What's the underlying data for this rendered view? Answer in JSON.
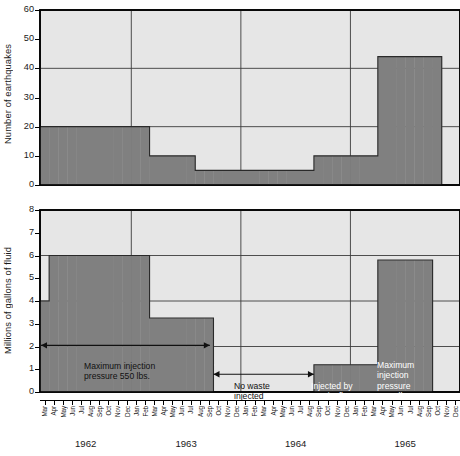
{
  "figure": {
    "width": 460,
    "height": 456,
    "bar_color": "#808080",
    "panel_bg": "#e6e6e6",
    "axis_color": "#000000",
    "grid_color": "#3c3c3c"
  },
  "months": [
    "Mar",
    "Apr",
    "May",
    "Jun",
    "Jul",
    "Aug",
    "Sep",
    "Oct",
    "Nov",
    "Dec",
    "Jan",
    "Feb",
    "Mar",
    "Apr",
    "May",
    "Jun",
    "Jul",
    "Aug",
    "Sep",
    "Oct",
    "Nov",
    "Dec",
    "Jan",
    "Feb",
    "Mar",
    "Apr",
    "May",
    "Jun",
    "Jul",
    "Aug",
    "Sep",
    "Oct",
    "Nov",
    "Dec",
    "Jan",
    "Feb",
    "Mar",
    "Apr",
    "May",
    "Jun",
    "Jul",
    "Aug",
    "Sep",
    "Oct",
    "Nov",
    "Dec"
  ],
  "years": [
    {
      "label": "1962",
      "start_index": 0,
      "end_index": 9
    },
    {
      "label": "1963",
      "start_index": 10,
      "end_index": 21
    },
    {
      "label": "1964",
      "start_index": 22,
      "end_index": 33
    },
    {
      "label": "1965",
      "start_index": 34,
      "end_index": 45
    }
  ],
  "chart_data": [
    {
      "id": "earthquakes",
      "type": "bar",
      "title": "Average number of Denver earthquakes per month",
      "xlabel": "",
      "ylabel": "Number of earthquakes",
      "ylim": [
        0,
        60
      ],
      "yticks": [
        0,
        10,
        20,
        30,
        40,
        50,
        60
      ],
      "gridlines_y": [
        20,
        40
      ],
      "grid": true,
      "x_start": "Mar 1962",
      "x_end": "Dec 1965",
      "categories": [
        "Mar 1962",
        "Apr 1962",
        "May 1962",
        "Jun 1962",
        "Jul 1962",
        "Aug 1962",
        "Sep 1962",
        "Oct 1962",
        "Nov 1962",
        "Dec 1962",
        "Jan 1963",
        "Feb 1963",
        "Mar 1963",
        "Apr 1963",
        "May 1963",
        "Jun 1963",
        "Jul 1963",
        "Aug 1963",
        "Sep 1963",
        "Oct 1963",
        "Nov 1963",
        "Dec 1963",
        "Jan 1964",
        "Feb 1964",
        "Mar 1964",
        "Apr 1964",
        "May 1964",
        "Jun 1964",
        "Jul 1964",
        "Aug 1964",
        "Sep 1964",
        "Oct 1964",
        "Nov 1964",
        "Dec 1964",
        "Jan 1965",
        "Feb 1965",
        "Mar 1965",
        "Apr 1965",
        "May 1965",
        "Jun 1965",
        "Jul 1965",
        "Aug 1965",
        "Sep 1965",
        "Oct 1965",
        "Nov 1965",
        "Dec 1965"
      ],
      "values": [
        20,
        20,
        20,
        20,
        20,
        20,
        20,
        20,
        20,
        20,
        20,
        20,
        10,
        10,
        10,
        10,
        10,
        5,
        5,
        5,
        5,
        5,
        5,
        5,
        5,
        5,
        5,
        5,
        5,
        5,
        10,
        10,
        10,
        10,
        10,
        10,
        10,
        44,
        44,
        44,
        44,
        44,
        44,
        44,
        0,
        0
      ]
    },
    {
      "id": "waste-injected",
      "type": "bar",
      "title": "Average gallons of waste injected per month in arsenal disposal well",
      "xlabel": "",
      "ylabel": "Millions of gallons of fluid",
      "ylim": [
        0,
        8
      ],
      "yticks": [
        0,
        1,
        2,
        3,
        4,
        5,
        6,
        7,
        8
      ],
      "gridlines_y": [
        2,
        4,
        6
      ],
      "grid": true,
      "x_start": "Mar 1962",
      "x_end": "Dec 1965",
      "categories": [
        "Mar 1962",
        "Apr 1962",
        "May 1962",
        "Jun 1962",
        "Jul 1962",
        "Aug 1962",
        "Sep 1962",
        "Oct 1962",
        "Nov 1962",
        "Dec 1962",
        "Jan 1963",
        "Feb 1963",
        "Mar 1963",
        "Apr 1963",
        "May 1963",
        "Jun 1963",
        "Jul 1963",
        "Aug 1963",
        "Sep 1963",
        "Oct 1963",
        "Nov 1963",
        "Dec 1963",
        "Jan 1964",
        "Feb 1964",
        "Mar 1964",
        "Apr 1964",
        "May 1964",
        "Jun 1964",
        "Jul 1964",
        "Aug 1964",
        "Sep 1964",
        "Oct 1964",
        "Nov 1964",
        "Dec 1964",
        "Jan 1965",
        "Feb 1965",
        "Mar 1965",
        "Apr 1965",
        "May 1965",
        "Jun 1965",
        "Jul 1965",
        "Aug 1965",
        "Sep 1965",
        "Oct 1965",
        "Nov 1965",
        "Dec 1965"
      ],
      "values": [
        4,
        6,
        6,
        6,
        6,
        6,
        6,
        6,
        6,
        6,
        6,
        6,
        3.25,
        3.25,
        3.25,
        3.25,
        3.25,
        3.25,
        3.25,
        0,
        0,
        0,
        0,
        0,
        0,
        0,
        0,
        0,
        0,
        0,
        1.2,
        1.2,
        1.2,
        1.2,
        1.2,
        1.2,
        1.2,
        5.8,
        5.8,
        5.8,
        5.8,
        5.8,
        5.8,
        0,
        0,
        0
      ],
      "annotations": [
        {
          "id": "max-550",
          "text_line1": "Maximum injection",
          "text_line2": "pressure 550 lbs.",
          "style": "dark-fill",
          "arrows": "both"
        },
        {
          "id": "no-waste",
          "text_line1": "No waste",
          "text_line2": "injected",
          "style": "light-fill",
          "arrows": "both"
        },
        {
          "id": "gravity-flow",
          "text_line1": "Injected by",
          "text_line2": "gravity flow",
          "style": "dark-fill",
          "arrows": "none"
        },
        {
          "id": "max-1050",
          "text_line1": "Maximum",
          "text_line2": "injection",
          "text_line3": "pressure",
          "text_line4": "1050 lbs.",
          "style": "dark-fill",
          "arrows": "none"
        }
      ]
    }
  ]
}
